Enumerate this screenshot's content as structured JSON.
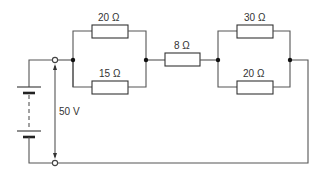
{
  "diagram": {
    "type": "circuit",
    "source": {
      "label": "50 V"
    },
    "resistors": {
      "r_top_left": {
        "label": "20 Ω"
      },
      "r_bottom_left": {
        "label": "15 Ω"
      },
      "r_series": {
        "label": "8 Ω"
      },
      "r_top_right": {
        "label": "30 Ω"
      },
      "r_bottom_right": {
        "label": "20 Ω"
      }
    },
    "colors": {
      "wire": "#555555",
      "junction": "#111111",
      "background": "#ffffff"
    }
  }
}
